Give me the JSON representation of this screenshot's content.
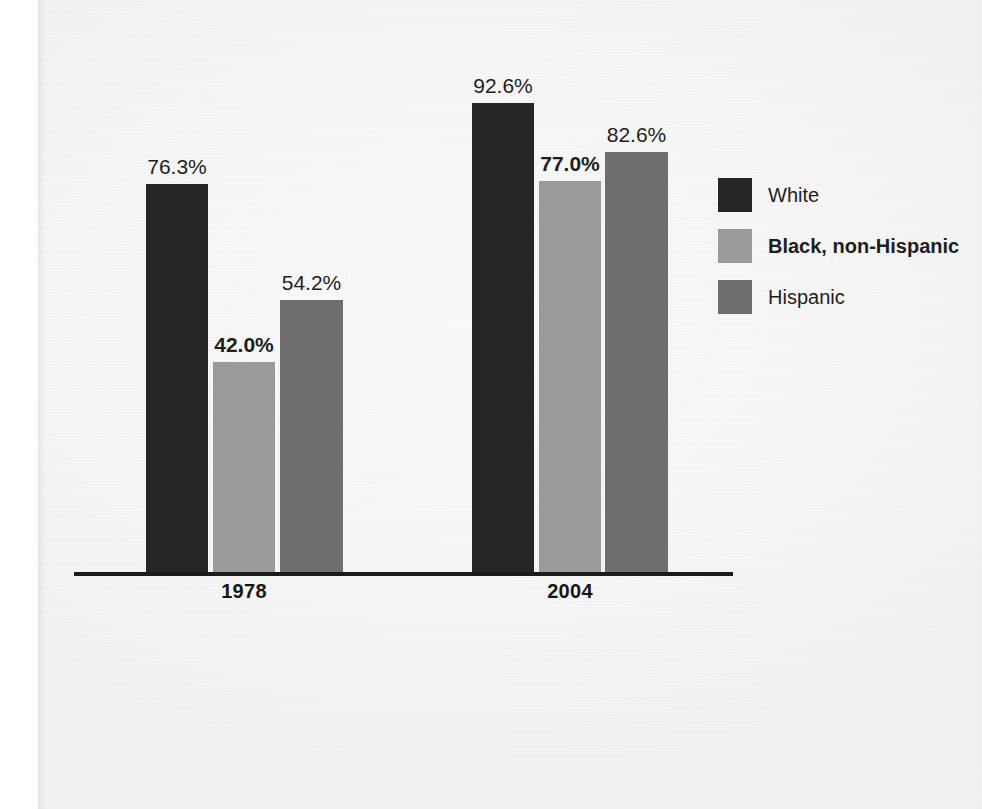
{
  "chart_data": {
    "type": "bar",
    "title": "",
    "subtitle": "",
    "xlabel": "",
    "ylabel": "",
    "categories": [
      "1978",
      "2004"
    ],
    "value_suffix": "%",
    "ylim": [
      0,
      100
    ],
    "grid": false,
    "legend_position": "right",
    "series": [
      {
        "name": "White",
        "color": "#262626",
        "values": [
          76.3,
          92.6
        ],
        "labels": [
          "76.3%",
          "92.6%"
        ],
        "label_bold": [
          false,
          false
        ]
      },
      {
        "name": "Black, non-Hispanic",
        "color": "#9a9a9a",
        "values": [
          42.0,
          77.0
        ],
        "labels": [
          "42.0%",
          "77.0%"
        ],
        "label_bold": [
          true,
          true
        ]
      },
      {
        "name": "Hispanic",
        "color": "#6e6e6e",
        "values": [
          54.2,
          82.6
        ],
        "labels": [
          "54.2%",
          "82.6%"
        ],
        "label_bold": [
          false,
          false
        ]
      }
    ]
  },
  "legend": {
    "items": [
      {
        "label": "White",
        "color": "#262626",
        "bold": false
      },
      {
        "label": "Black, non-Hispanic",
        "color": "#9a9a9a",
        "bold": true
      },
      {
        "label": "Hispanic",
        "color": "#6e6e6e",
        "bold": false
      }
    ]
  },
  "axis": {
    "group_labels": [
      "1978",
      "2004"
    ],
    "baseline_color": "#1b1b1b"
  },
  "bars": [
    {
      "name": "bar-1978-white",
      "label": "76.3%",
      "bold": false,
      "color": "#262626",
      "x": 146,
      "width": 62,
      "height": 390
    },
    {
      "name": "bar-1978-black-non-hispanic",
      "label": "42.0%",
      "bold": true,
      "color": "#9a9a9a",
      "x": 213,
      "width": 62,
      "height": 212
    },
    {
      "name": "bar-1978-hispanic",
      "label": "54.2%",
      "bold": false,
      "color": "#6e6e6e",
      "x": 280,
      "width": 63,
      "height": 274
    },
    {
      "name": "bar-2004-white",
      "label": "92.6%",
      "bold": false,
      "color": "#262626",
      "x": 472,
      "width": 62,
      "height": 471
    },
    {
      "name": "bar-2004-black-non-hispanic",
      "label": "77.0%",
      "bold": true,
      "color": "#9a9a9a",
      "x": 539,
      "width": 62,
      "height": 393
    },
    {
      "name": "bar-2004-hispanic",
      "label": "82.6%",
      "bold": false,
      "color": "#6e6e6e",
      "x": 605,
      "width": 63,
      "height": 422
    }
  ],
  "groups": [
    {
      "label": "1978",
      "center": 244
    },
    {
      "label": "2004",
      "center": 570
    }
  ],
  "scan_artifacts": {
    "ghosts": [
      "",
      "",
      ""
    ]
  }
}
